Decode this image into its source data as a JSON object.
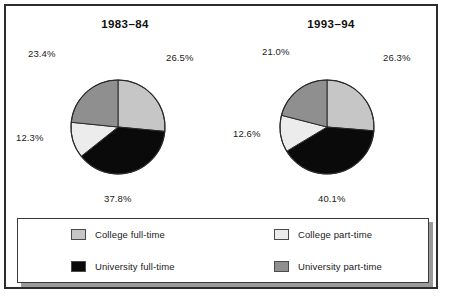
{
  "figure": {
    "background": "#ffffff",
    "frame_color": "#2c2c2c"
  },
  "colors": {
    "college_full_time": "#c6c6c6",
    "university_full_time": "#0a0a0a",
    "college_part_time": "#ececec",
    "university_part_time": "#8f8f8f",
    "slice_outline": "#2b2b2b",
    "text": "#1a1a1a"
  },
  "legend": {
    "items": [
      {
        "label": "College full-time",
        "color": "#c6c6c6",
        "swatch": "swatch-college-full-time"
      },
      {
        "label": "College part-time",
        "color": "#ececec",
        "swatch": "swatch-college-part-time"
      },
      {
        "label": "University full-time",
        "color": "#0a0a0a",
        "swatch": "swatch-university-full-time"
      },
      {
        "label": "University part-time",
        "color": "#8f8f8f",
        "swatch": "swatch-university-part-time"
      }
    ]
  },
  "chart_data": [
    {
      "type": "pie",
      "title": "1983–84",
      "categories": [
        "College full-time",
        "University full-time",
        "College part-time",
        "University part-time"
      ],
      "values": [
        26.5,
        37.8,
        12.3,
        23.4
      ],
      "labels": [
        "26.5%",
        "37.8%",
        "12.3%",
        "23.4%"
      ],
      "colors": [
        "#c6c6c6",
        "#0a0a0a",
        "#ececec",
        "#8f8f8f"
      ],
      "start_angle_deg": 0,
      "direction": "clockwise",
      "legend_position": "bottom",
      "grid": false
    },
    {
      "type": "pie",
      "title": "1993–94",
      "categories": [
        "College full-time",
        "University full-time",
        "College part-time",
        "University part-time"
      ],
      "values": [
        26.3,
        40.1,
        12.6,
        21.0
      ],
      "labels": [
        "26.3%",
        "40.1%",
        "12.6%",
        "21.0%"
      ],
      "colors": [
        "#c6c6c6",
        "#0a0a0a",
        "#ececec",
        "#8f8f8f"
      ],
      "start_angle_deg": 0,
      "direction": "clockwise",
      "legend_position": "bottom",
      "grid": false
    }
  ]
}
